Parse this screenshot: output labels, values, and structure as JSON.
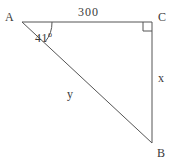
{
  "figure": {
    "type": "right-triangle-diagram",
    "background_color": "#ffffff",
    "stroke_color": "#555555"
  },
  "vertices": [
    {
      "id": "A",
      "label": "A",
      "x": 22,
      "y": 22
    },
    {
      "id": "C",
      "label": "C",
      "x": 152,
      "y": 22
    },
    {
      "id": "B",
      "label": "B",
      "x": 152,
      "y": 143
    }
  ],
  "sides": [
    {
      "id": "AC",
      "label": "300",
      "from": "A",
      "to": "C",
      "position": "top"
    },
    {
      "id": "CB",
      "label": "x",
      "from": "C",
      "to": "B",
      "position": "right"
    },
    {
      "id": "AB",
      "label": "y",
      "from": "A",
      "to": "B",
      "position": "hypotenuse"
    }
  ],
  "angles": [
    {
      "id": "angle-A",
      "at": "A",
      "value": "41",
      "degree_symbol": "o",
      "label": "41o",
      "marker": "arc"
    },
    {
      "id": "angle-C",
      "at": "C",
      "value": "90",
      "label": "",
      "marker": "right-angle-square"
    }
  ]
}
